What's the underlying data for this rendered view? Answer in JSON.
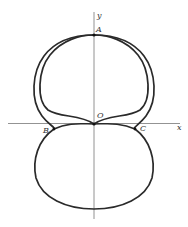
{
  "diagram": {
    "type": "polar-curves",
    "axes": {
      "x_label": "x",
      "y_label": "y"
    },
    "points": {
      "A": "A",
      "O": "O",
      "B": "B",
      "C": "C"
    },
    "colors": {
      "curve": "#2a2a2a",
      "axis": "#777777",
      "background": "#ffffff"
    }
  }
}
